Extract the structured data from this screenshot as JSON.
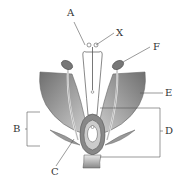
{
  "diagram": {
    "labels": {
      "A": "A",
      "X": "X",
      "F": "F",
      "E": "E",
      "B": "B",
      "C": "C",
      "D": "D"
    },
    "colors": {
      "petal_dark": "#7a7a7a",
      "petal_light": "#d8d8d8",
      "line": "#555555",
      "background": "#ffffff"
    }
  }
}
